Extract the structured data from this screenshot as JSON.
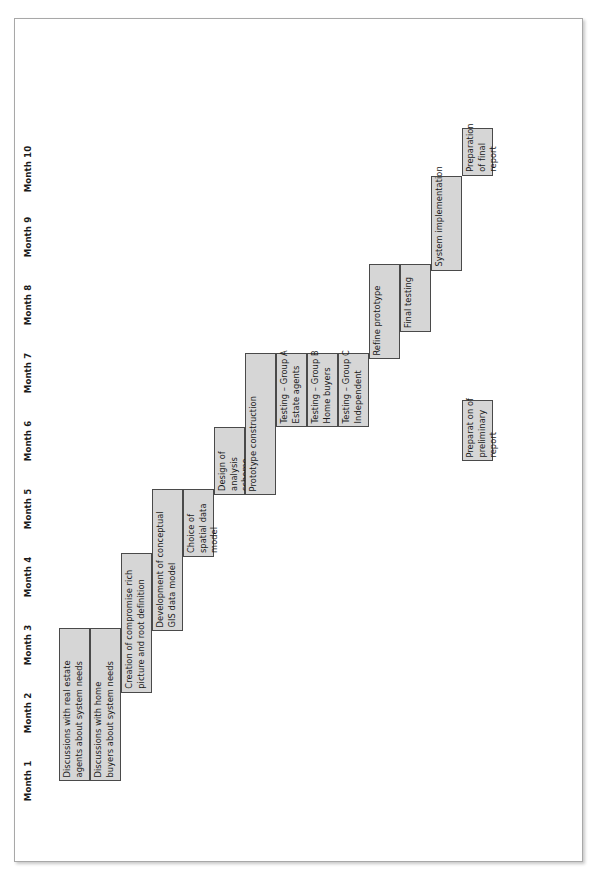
{
  "chart_data": {
    "type": "bar",
    "chart_kind": "gantt",
    "title": "",
    "xlabel": "",
    "ylabel": "",
    "orientation": "rotated-90-ccw",
    "axis_labels": [
      "Month 1",
      "Month 2",
      "Month 3",
      "Month 4",
      "Month 5",
      "Month 6",
      "Month 7",
      "Month 8",
      "Month 9",
      "Month 10"
    ],
    "axis_range": [
      1,
      10
    ],
    "grid": false,
    "legend": false,
    "categories": [
      "Discussions with real estate agents about system needs",
      "Discussions with home buyers about system needs",
      "Creation of compromise rich picture and root definition",
      "Development of conceptual GIS data model",
      "Choice of spatial data model",
      "Design of analysis scheme",
      "Prototype construction",
      "Testing – Group A Estate agents",
      "Testing – Group B Home buyers",
      "Testing – Group C Independent",
      "Refine prototype",
      "Final testing",
      "System implementation",
      "Preparation of final report",
      "Preparation of preliminary report"
    ],
    "tasks": [
      {
        "label": "Discussions with real estate\nagents about system needs",
        "start_month": 1.0,
        "end_month": 3.25,
        "row": 0
      },
      {
        "label": "Discussions with home\nbuyers about system needs",
        "start_month": 1.0,
        "end_month": 3.25,
        "row": 1
      },
      {
        "label": "Creation of compromise rich\npicture and root definition",
        "start_month": 2.3,
        "end_month": 4.35,
        "row": 2
      },
      {
        "label": "Development of conceptual\nGIS data model",
        "start_month": 3.2,
        "end_month": 5.3,
        "row": 3
      },
      {
        "label": "Choice of\nspatial data\nmodel",
        "start_month": 4.3,
        "end_month": 5.3,
        "row": 4
      },
      {
        "label": "Design of\nanalysis\nscheme",
        "start_month": 5.2,
        "end_month": 6.2,
        "row": 5
      },
      {
        "label": "Prototype construction",
        "start_month": 5.2,
        "end_month": 7.3,
        "row": 6
      },
      {
        "label": "Testing – Group A\nEstate agents",
        "start_month": 6.2,
        "end_month": 7.3,
        "row": 7
      },
      {
        "label": "Testing – Group B\nHome buyers",
        "start_month": 6.2,
        "end_month": 7.3,
        "row": 8
      },
      {
        "label": "Testing – Group C\nIndependent",
        "start_month": 6.2,
        "end_month": 7.3,
        "row": 9
      },
      {
        "label": "Refine prototype",
        "start_month": 7.2,
        "end_month": 8.6,
        "row": 10
      },
      {
        "label": "Final testing",
        "start_month": 7.6,
        "end_month": 8.6,
        "row": 11
      },
      {
        "label": "System implementation",
        "start_month": 8.5,
        "end_month": 9.9,
        "row": 12
      },
      {
        "label": "Preparation\nof final\nreport",
        "start_month": 9.9,
        "end_month": 10.6,
        "row": 13
      },
      {
        "label": "Preparat on of\npreliminary\nreport",
        "start_month": 5.7,
        "end_month": 6.6,
        "row": 13
      }
    ]
  },
  "colors": {
    "bar_fill": "#d6d6d6",
    "bar_border": "#4a4a4a",
    "frame_border": "#a8a8a8",
    "background": "#ffffff",
    "text": "#1a1a1a"
  }
}
